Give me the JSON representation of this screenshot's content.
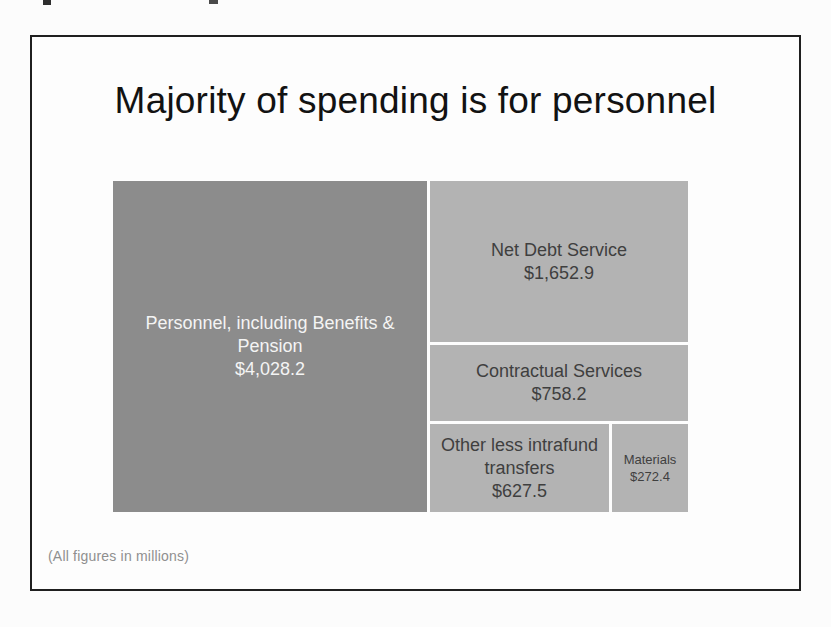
{
  "page": {
    "background": "#fcfcfc",
    "slide_border_color": "#1f1f1f"
  },
  "slide": {
    "title": "Majority of spending is for personnel",
    "footnote": "(All figures in millions)"
  },
  "chart_data": {
    "type": "treemap",
    "title": "Majority of spending is for personnel",
    "note": "(All figures in millions)",
    "items": [
      {
        "label": "Personnel, including Benefits & Pension",
        "value": 4028.2,
        "value_label": "$4,028.2",
        "color": "#8c8c8c",
        "text_color": "#f4f4f4"
      },
      {
        "label": "Net Debt Service",
        "value": 1652.9,
        "value_label": "$1,652.9",
        "color": "#b3b3b3",
        "text_color": "#3f3f3f"
      },
      {
        "label": "Contractual Services",
        "value": 758.2,
        "value_label": "$758.2",
        "color": "#b3b3b3",
        "text_color": "#3f3f3f"
      },
      {
        "label": "Other less intrafund transfers",
        "value": 627.5,
        "value_label": "$627.5",
        "color": "#b3b3b3",
        "text_color": "#3f3f3f"
      },
      {
        "label": "Materials",
        "value": 272.4,
        "value_label": "$272.4",
        "color": "#b3b3b3",
        "text_color": "#3f3f3f"
      }
    ]
  }
}
